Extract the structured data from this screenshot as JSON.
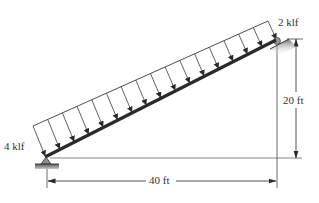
{
  "figure": {
    "type": "inclined beam with linearly varying distributed load",
    "labels": {
      "load_right": "2 klf",
      "load_left": "4 klf",
      "vertical_dimension": "20 ft",
      "horizontal_dimension": "40 ft"
    },
    "supports": {
      "left": "pin",
      "right": "roller on inclined surface"
    },
    "load": {
      "left_intensity": "4 klf",
      "right_intensity": "2 klf",
      "direction": "vertical downward",
      "arrow_count": 17
    },
    "geometry": {
      "rise": "20 ft",
      "span": "40 ft"
    },
    "colors": {
      "beam": "#2a2a2a",
      "lines": "#3a3a3a",
      "support_fill": "#9a9a9a",
      "background": "#ffffff"
    }
  }
}
